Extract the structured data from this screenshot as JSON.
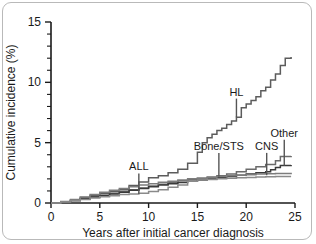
{
  "chart_data": {
    "type": "line",
    "title": "",
    "subtitle": "",
    "xlabel": "Years after initial cancer diagnosis",
    "ylabel": "Cumulative incidence (%)",
    "xlim": [
      0,
      25
    ],
    "ylim": [
      0,
      15
    ],
    "xticks": [
      0,
      5,
      10,
      15,
      20,
      25
    ],
    "xtick_labels": [
      "0",
      "5",
      "10",
      "15",
      "20",
      "25"
    ],
    "yticks": [
      0,
      5,
      10,
      15
    ],
    "ytick_labels": [
      "0",
      "5",
      "10",
      "15"
    ],
    "yminor_ticks": [
      1,
      2,
      3,
      4,
      6,
      7,
      8,
      9,
      11,
      12,
      13,
      14
    ],
    "grid": false,
    "legend": "inline-annotations",
    "step_curves": true,
    "annotations": [
      {
        "label": "HL",
        "x": 19.0,
        "y": 8.9,
        "pointer_to_y": 7.1,
        "color": "#555555"
      },
      {
        "label": "Bone/STS",
        "x": 17.2,
        "y": 4.4,
        "pointer_to_y": 2.2,
        "color": "#555555"
      },
      {
        "label": "CNS",
        "x": 22.1,
        "y": 4.4,
        "pointer_to_y": 2.3,
        "color": "#555555"
      },
      {
        "label": "Other",
        "x": 23.9,
        "y": 5.5,
        "pointer_to_y": 3.1,
        "color": "#555555"
      },
      {
        "label": "ALL",
        "x": 9.0,
        "y": 2.7,
        "pointer_to_y": 0.75,
        "color": "#555555"
      }
    ],
    "series": [
      {
        "name": "HL",
        "color": "#5c5c5c",
        "points": [
          [
            0,
            0
          ],
          [
            1,
            0.1
          ],
          [
            2,
            0.25
          ],
          [
            3,
            0.45
          ],
          [
            4,
            0.6
          ],
          [
            5,
            0.8
          ],
          [
            6,
            0.95
          ],
          [
            7,
            1.1
          ],
          [
            8,
            1.45
          ],
          [
            9,
            1.75
          ],
          [
            10,
            2.1
          ],
          [
            11,
            2.25
          ],
          [
            12,
            2.5
          ],
          [
            13,
            2.8
          ],
          [
            14,
            3.3
          ],
          [
            15,
            4.2
          ],
          [
            15.5,
            5.0
          ],
          [
            16,
            5.4
          ],
          [
            16.5,
            5.7
          ],
          [
            17,
            6.0
          ],
          [
            17.5,
            6.2
          ],
          [
            18,
            6.5
          ],
          [
            18.5,
            6.8
          ],
          [
            19,
            7.1
          ],
          [
            19.5,
            7.9
          ],
          [
            20,
            8.2
          ],
          [
            20.5,
            8.5
          ],
          [
            21,
            8.8
          ],
          [
            21.5,
            9.3
          ],
          [
            22,
            9.6
          ],
          [
            22.5,
            10.2
          ],
          [
            23,
            10.7
          ],
          [
            23.5,
            11.4
          ],
          [
            24,
            12.0
          ],
          [
            24.6,
            12.1
          ]
        ]
      },
      {
        "name": "Other",
        "color": "#6b6b6b",
        "points": [
          [
            0,
            0
          ],
          [
            1,
            0.1
          ],
          [
            2,
            0.2
          ],
          [
            3,
            0.35
          ],
          [
            4,
            0.5
          ],
          [
            5,
            0.65
          ],
          [
            6,
            0.8
          ],
          [
            7,
            0.95
          ],
          [
            8,
            1.1
          ],
          [
            9,
            1.25
          ],
          [
            10,
            1.4
          ],
          [
            11,
            1.55
          ],
          [
            12,
            1.7
          ],
          [
            13,
            1.85
          ],
          [
            14,
            1.95
          ],
          [
            15,
            2.05
          ],
          [
            16,
            2.15
          ],
          [
            17,
            2.25
          ],
          [
            18,
            2.4
          ],
          [
            19,
            2.6
          ],
          [
            20,
            2.8
          ],
          [
            21,
            3.0
          ],
          [
            22,
            3.2
          ],
          [
            23,
            3.5
          ],
          [
            23.5,
            3.85
          ],
          [
            24.6,
            3.9
          ]
        ]
      },
      {
        "name": "CNS",
        "color": "#3a3a3a",
        "points": [
          [
            0,
            0
          ],
          [
            1,
            0.1
          ],
          [
            2,
            0.2
          ],
          [
            3,
            0.35
          ],
          [
            4,
            0.5
          ],
          [
            5,
            0.62
          ],
          [
            6,
            0.75
          ],
          [
            7,
            0.9
          ],
          [
            8,
            1.05
          ],
          [
            9,
            1.2
          ],
          [
            10,
            1.35
          ],
          [
            11,
            1.5
          ],
          [
            12,
            1.6
          ],
          [
            13,
            1.7
          ],
          [
            14,
            1.8
          ],
          [
            15,
            1.9
          ],
          [
            16,
            2.0
          ],
          [
            17,
            2.1
          ],
          [
            18,
            2.2
          ],
          [
            19,
            2.3
          ],
          [
            20,
            2.4
          ],
          [
            21,
            2.5
          ],
          [
            22,
            2.6
          ],
          [
            22.5,
            2.75
          ],
          [
            23,
            2.95
          ],
          [
            23.5,
            3.1
          ],
          [
            24.6,
            3.15
          ]
        ]
      },
      {
        "name": "Bone/STS",
        "color": "#7c7c7c",
        "points": [
          [
            0,
            0
          ],
          [
            1,
            0.12
          ],
          [
            2,
            0.3
          ],
          [
            3,
            0.5
          ],
          [
            4,
            0.7
          ],
          [
            5,
            0.9
          ],
          [
            6,
            1.05
          ],
          [
            7,
            1.2
          ],
          [
            8,
            1.35
          ],
          [
            9,
            1.5
          ],
          [
            10,
            1.6
          ],
          [
            11,
            1.72
          ],
          [
            12,
            1.8
          ],
          [
            13,
            1.9
          ],
          [
            14,
            2.0
          ],
          [
            15,
            2.05
          ],
          [
            16,
            2.1
          ],
          [
            17,
            2.2
          ],
          [
            18,
            2.25
          ],
          [
            19,
            2.3
          ],
          [
            20,
            2.35
          ],
          [
            21,
            2.4
          ],
          [
            22,
            2.42
          ],
          [
            23,
            2.45
          ],
          [
            24.6,
            2.5
          ]
        ]
      },
      {
        "name": "ALL",
        "color": "#8a8a8a",
        "points": [
          [
            0,
            0
          ],
          [
            1,
            0.08
          ],
          [
            2,
            0.18
          ],
          [
            3,
            0.3
          ],
          [
            4,
            0.42
          ],
          [
            5,
            0.52
          ],
          [
            6,
            0.6
          ],
          [
            7,
            0.7
          ],
          [
            8,
            0.75
          ],
          [
            9,
            0.8
          ],
          [
            10,
            0.95
          ],
          [
            11,
            1.1
          ],
          [
            12,
            1.3
          ],
          [
            13,
            1.5
          ],
          [
            14,
            1.8
          ],
          [
            15,
            1.9
          ],
          [
            16,
            1.95
          ],
          [
            17,
            2.0
          ],
          [
            18,
            2.05
          ],
          [
            19,
            2.1
          ],
          [
            20,
            2.12
          ],
          [
            21,
            2.15
          ],
          [
            22,
            2.18
          ],
          [
            23,
            2.2
          ],
          [
            24.6,
            2.2
          ]
        ]
      }
    ]
  },
  "axes": {
    "y_title": "Cumulative incidence (%)",
    "x_title": "Years after initial cancer diagnosis"
  },
  "colors": {
    "axis": "#1a1a1a",
    "frame": "#b9b9b9",
    "background": "#ffffff"
  }
}
